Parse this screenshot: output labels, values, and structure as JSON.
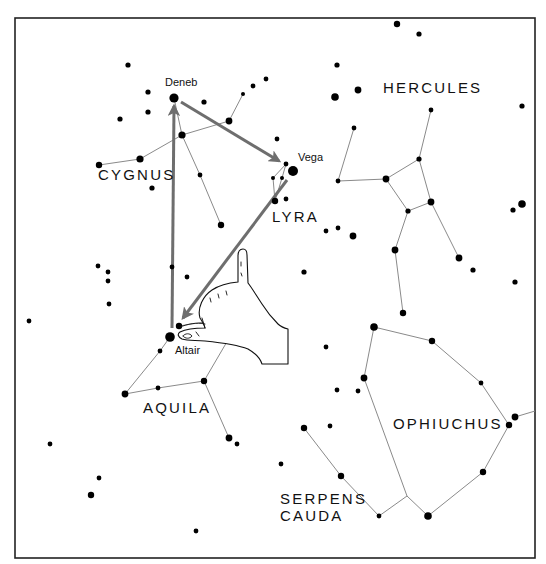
{
  "diagram": {
    "type": "star-chart",
    "frame": {
      "x": 15,
      "y": 18,
      "width": 520,
      "height": 540,
      "border_color": "#222222"
    },
    "colors": {
      "star": "#000000",
      "constellation_line": "#8a8a8a",
      "arrow": "#6e6e6e",
      "background": "#ffffff"
    },
    "constellation_labels": [
      {
        "id": "cygnus",
        "text": "CYGNUS",
        "x": 98,
        "y": 180
      },
      {
        "id": "lyra",
        "text": "LYRA",
        "x": 272,
        "y": 222
      },
      {
        "id": "hercules",
        "text": "HERCULES",
        "x": 383,
        "y": 93
      },
      {
        "id": "aquila",
        "text": "AQUILA",
        "x": 143,
        "y": 413
      },
      {
        "id": "ophiuchus",
        "text": "OPHIUCHUS",
        "x": 393,
        "y": 429
      },
      {
        "id": "serpens",
        "text": "SERPENS",
        "x": 280,
        "y": 504
      },
      {
        "id": "cauda",
        "text": "CAUDA",
        "x": 280,
        "y": 521
      }
    ],
    "star_labels": [
      {
        "id": "deneb",
        "text": "Deneb",
        "x": 165,
        "y": 86
      },
      {
        "id": "vega",
        "text": "Vega",
        "x": 298,
        "y": 161
      },
      {
        "id": "altair",
        "text": "Altair",
        "x": 175,
        "y": 354
      }
    ],
    "stars": [
      {
        "x": 128,
        "y": 65,
        "r": 2.6
      },
      {
        "x": 174,
        "y": 98,
        "r": 4.6
      },
      {
        "x": 148,
        "y": 92,
        "r": 2.6
      },
      {
        "x": 148,
        "y": 112,
        "r": 2.6
      },
      {
        "x": 120,
        "y": 119,
        "r": 2.6
      },
      {
        "x": 204,
        "y": 102,
        "r": 2.6
      },
      {
        "x": 243,
        "y": 94,
        "r": 2.0
      },
      {
        "x": 253,
        "y": 86,
        "r": 2.4
      },
      {
        "x": 266,
        "y": 79,
        "r": 2.4
      },
      {
        "x": 229,
        "y": 121,
        "r": 3.4
      },
      {
        "x": 182,
        "y": 135,
        "r": 3.6
      },
      {
        "x": 140,
        "y": 159,
        "r": 3.6
      },
      {
        "x": 99,
        "y": 165,
        "r": 3.2
      },
      {
        "x": 152,
        "y": 188,
        "r": 2.6
      },
      {
        "x": 200,
        "y": 175,
        "r": 2.4
      },
      {
        "x": 221,
        "y": 225,
        "r": 3.2
      },
      {
        "x": 277,
        "y": 139,
        "r": 2.4
      },
      {
        "x": 397,
        "y": 24,
        "r": 3.2
      },
      {
        "x": 419,
        "y": 34,
        "r": 2.6
      },
      {
        "x": 337,
        "y": 65,
        "r": 2.6
      },
      {
        "x": 358,
        "y": 90,
        "r": 3.4
      },
      {
        "x": 335,
        "y": 97,
        "r": 3.8
      },
      {
        "x": 522,
        "y": 106,
        "r": 2.6
      },
      {
        "x": 293,
        "y": 171,
        "r": 5.0
      },
      {
        "x": 286,
        "y": 164,
        "r": 2.4
      },
      {
        "x": 273,
        "y": 178,
        "r": 2.0
      },
      {
        "x": 282,
        "y": 178,
        "r": 2.0
      },
      {
        "x": 275,
        "y": 201,
        "r": 3.2
      },
      {
        "x": 286,
        "y": 199,
        "r": 2.4
      },
      {
        "x": 354,
        "y": 128,
        "r": 2.4
      },
      {
        "x": 431,
        "y": 110,
        "r": 2.4
      },
      {
        "x": 419,
        "y": 159,
        "r": 2.6
      },
      {
        "x": 386,
        "y": 179,
        "r": 3.4
      },
      {
        "x": 338,
        "y": 181,
        "r": 2.4
      },
      {
        "x": 431,
        "y": 202,
        "r": 3.4
      },
      {
        "x": 408,
        "y": 211,
        "r": 2.6
      },
      {
        "x": 395,
        "y": 250,
        "r": 3.4
      },
      {
        "x": 459,
        "y": 258,
        "r": 3.4
      },
      {
        "x": 473,
        "y": 270,
        "r": 2.6
      },
      {
        "x": 403,
        "y": 313,
        "r": 3.2
      },
      {
        "x": 326,
        "y": 231,
        "r": 2.4
      },
      {
        "x": 338,
        "y": 228,
        "r": 2.4
      },
      {
        "x": 353,
        "y": 236,
        "r": 3.4
      },
      {
        "x": 513,
        "y": 210,
        "r": 2.6
      },
      {
        "x": 522,
        "y": 204,
        "r": 3.8
      },
      {
        "x": 515,
        "y": 282,
        "r": 2.6
      },
      {
        "x": 304,
        "y": 272,
        "r": 2.6
      },
      {
        "x": 374,
        "y": 327,
        "r": 3.8
      },
      {
        "x": 432,
        "y": 341,
        "r": 3.2
      },
      {
        "x": 481,
        "y": 383,
        "r": 2.4
      },
      {
        "x": 509,
        "y": 425,
        "r": 3.2
      },
      {
        "x": 515,
        "y": 417,
        "r": 3.4
      },
      {
        "x": 483,
        "y": 472,
        "r": 3.2
      },
      {
        "x": 428,
        "y": 516,
        "r": 3.8
      },
      {
        "x": 379,
        "y": 516,
        "r": 2.4
      },
      {
        "x": 341,
        "y": 476,
        "r": 3.2
      },
      {
        "x": 304,
        "y": 428,
        "r": 3.2
      },
      {
        "x": 330,
        "y": 426,
        "r": 2.4
      },
      {
        "x": 364,
        "y": 378,
        "r": 3.4
      },
      {
        "x": 337,
        "y": 390,
        "r": 2.4
      },
      {
        "x": 358,
        "y": 391,
        "r": 2.4
      },
      {
        "x": 326,
        "y": 347,
        "r": 2.4
      },
      {
        "x": 281,
        "y": 464,
        "r": 2.4
      },
      {
        "x": 98,
        "y": 266,
        "r": 2.4
      },
      {
        "x": 108,
        "y": 272,
        "r": 2.4
      },
      {
        "x": 108,
        "y": 281,
        "r": 2.4
      },
      {
        "x": 109,
        "y": 304,
        "r": 2.4
      },
      {
        "x": 29,
        "y": 321,
        "r": 2.4
      },
      {
        "x": 172,
        "y": 267,
        "r": 2.4
      },
      {
        "x": 187,
        "y": 277,
        "r": 2.4
      },
      {
        "x": 170,
        "y": 337,
        "r": 4.8
      },
      {
        "x": 179,
        "y": 326,
        "r": 3.2
      },
      {
        "x": 160,
        "y": 351,
        "r": 2.4
      },
      {
        "x": 125,
        "y": 394,
        "r": 3.4
      },
      {
        "x": 158,
        "y": 388,
        "r": 2.4
      },
      {
        "x": 204,
        "y": 381,
        "r": 3.2
      },
      {
        "x": 242,
        "y": 316,
        "r": 3.2
      },
      {
        "x": 252,
        "y": 309,
        "r": 2.6
      },
      {
        "x": 229,
        "y": 438,
        "r": 3.4
      },
      {
        "x": 237,
        "y": 444,
        "r": 2.4
      },
      {
        "x": 50,
        "y": 444,
        "r": 2.4
      },
      {
        "x": 99,
        "y": 478,
        "r": 2.4
      },
      {
        "x": 91,
        "y": 495,
        "r": 3.2
      },
      {
        "x": 196,
        "y": 531,
        "r": 2.4
      }
    ],
    "constellation_lines": [
      {
        "name": "cygnus",
        "points": "99,165 140,159 182,135 229,121 243,94"
      },
      {
        "name": "cygnus-body",
        "points": "174,98 182,135 200,175 221,225"
      },
      {
        "name": "lyra",
        "points": "286,164 282,178 275,201"
      },
      {
        "name": "lyra-2",
        "points": "286,164 273,178 275,201"
      },
      {
        "name": "hercules-a",
        "points": "354,128 338,181 386,179 419,159 431,110"
      },
      {
        "name": "hercules-b",
        "points": "386,179 408,211 431,202 419,159"
      },
      {
        "name": "hercules-c",
        "points": "431,202 459,258"
      },
      {
        "name": "hercules-d",
        "points": "408,211 395,250 403,313"
      },
      {
        "name": "ophiuchus",
        "points": "374,327 432,341 481,383 509,425 483,472 428,516 407,496 364,378 374,327"
      },
      {
        "name": "ophiuchus-tail",
        "points": "515,417 535,411"
      },
      {
        "name": "serpens-cauda",
        "points": "304,428 341,476 379,516 407,496"
      },
      {
        "name": "aquila-a",
        "points": "179,326 242,316 204,381 158,388 125,394 160,351 170,337"
      },
      {
        "name": "aquila-b",
        "points": "204,381 229,438"
      }
    ],
    "arrows": [
      {
        "id": "altair-to-deneb",
        "from": [
          172,
          328
        ],
        "to": [
          174,
          106
        ]
      },
      {
        "id": "deneb-to-vega",
        "from": [
          181,
          102
        ],
        "to": [
          279,
          161
        ]
      },
      {
        "id": "vega-to-altair",
        "from": [
          287,
          180
        ],
        "to": [
          183,
          318
        ]
      }
    ],
    "hand": {
      "icon": "pointing-hand-icon",
      "pointing_at": "Altair"
    }
  }
}
